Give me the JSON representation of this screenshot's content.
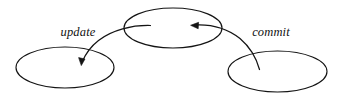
{
  "diagram": {
    "type": "state-transition-diagram",
    "background_color": "#ffffff",
    "stroke_color": "#141414",
    "nodes": [
      {
        "id": "center",
        "label": "",
        "cx": 173,
        "cy": 28,
        "rx": 49,
        "ry": 20
      },
      {
        "id": "left",
        "label": "",
        "cx": 65,
        "cy": 67.5,
        "rx": 49,
        "ry": 20.5
      },
      {
        "id": "right",
        "label": "",
        "cx": 277.5,
        "cy": 71.5,
        "rx": 49.5,
        "ry": 20.5
      }
    ],
    "edges": [
      {
        "id": "update-edge",
        "label": "update",
        "from": "center",
        "to": "left",
        "label_x": 78,
        "label_y": 36
      },
      {
        "id": "commit-edge",
        "label": "commit",
        "from": "right",
        "to": "center",
        "label_x": 271,
        "label_y": 36
      }
    ]
  }
}
